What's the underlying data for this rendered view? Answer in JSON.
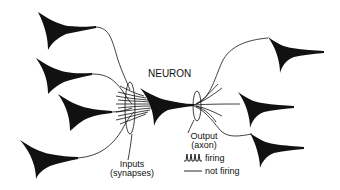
{
  "diagram": {
    "title": "NEURON",
    "labels": {
      "inputs_line1": "Inputs",
      "inputs_line2": "(synapses)",
      "output_line1": "Output",
      "output_line2": "(axon)"
    },
    "legend": [
      {
        "symbol": "spike-train",
        "label": "firing"
      },
      {
        "symbol": "flat-line",
        "label": "not firing"
      }
    ],
    "colors": {
      "ink": "#111111",
      "background": "#ffffff"
    },
    "input_neurons": 4,
    "output_neurons": 3
  }
}
